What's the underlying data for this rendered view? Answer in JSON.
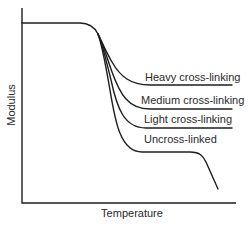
{
  "diagram": {
    "title": "",
    "axes": {
      "x_label": "Temperature",
      "y_label": "Modulus"
    },
    "curves": [
      {
        "id": "heavy",
        "label": "Heavy cross-linking"
      },
      {
        "id": "medium",
        "label": "Medium cross-linking"
      },
      {
        "id": "light",
        "label": "Light cross-linking"
      },
      {
        "id": "uncross",
        "label": "Uncross-linked"
      }
    ],
    "colors": {
      "line": "#1e1e1e",
      "text": "#2a2a2a",
      "background": "#ffffff"
    }
  }
}
